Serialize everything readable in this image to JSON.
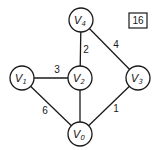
{
  "graph": {
    "nodes": [
      {
        "id": "V0",
        "name": "V",
        "sub": "0",
        "x": 80,
        "y": 134
      },
      {
        "id": "V1",
        "name": "V",
        "sub": "1",
        "x": 22,
        "y": 78
      },
      {
        "id": "V2",
        "name": "V",
        "sub": "2",
        "x": 80,
        "y": 78
      },
      {
        "id": "V3",
        "name": "V",
        "sub": "3",
        "x": 138,
        "y": 78
      },
      {
        "id": "V4",
        "name": "V",
        "sub": "4",
        "x": 81,
        "y": 20
      }
    ],
    "edges": [
      {
        "from": "V1",
        "to": "V2",
        "weight": "3",
        "lx": 57,
        "ly": 73
      },
      {
        "from": "V1",
        "to": "V0",
        "weight": "6",
        "lx": 45,
        "ly": 114
      },
      {
        "from": "V2",
        "to": "V0",
        "weight": "",
        "lx": 0,
        "ly": 0
      },
      {
        "from": "V4",
        "to": "V2",
        "weight": "2",
        "lx": 86,
        "ly": 53
      },
      {
        "from": "V4",
        "to": "V3",
        "weight": "4",
        "lx": 116,
        "ly": 48
      },
      {
        "from": "V3",
        "to": "V0",
        "weight": "1",
        "lx": 116,
        "ly": 112
      }
    ],
    "node_radius": 12
  },
  "box": {
    "label": "16",
    "x": 129,
    "y": 13,
    "w": 18,
    "h": 15
  }
}
